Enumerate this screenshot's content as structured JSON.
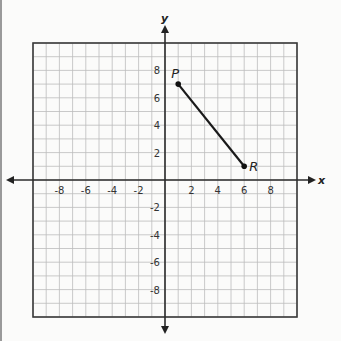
{
  "chart_data": {
    "type": "scatter",
    "title": "",
    "xlabel": "x",
    "ylabel": "y",
    "xlim": [
      -10,
      10
    ],
    "ylim": [
      -10,
      10
    ],
    "grid": true,
    "grid_step": 1,
    "x_ticks": [
      -8,
      -6,
      -4,
      -2,
      2,
      4,
      6,
      8
    ],
    "y_ticks": [
      8,
      6,
      4,
      2,
      -2,
      -4,
      -6,
      -8
    ],
    "x_tick_labels": [
      "-8",
      "-6",
      "-4",
      "-2",
      "2",
      "4",
      "6",
      "8"
    ],
    "y_tick_labels": [
      "8",
      "6",
      "4",
      "2",
      "-2",
      "-4",
      "-6",
      "-8"
    ],
    "points": [
      {
        "label": "P",
        "x": 1,
        "y": 7
      },
      {
        "label": "R",
        "x": 6,
        "y": 1
      }
    ],
    "segments": [
      {
        "from": "P",
        "to": "R"
      }
    ]
  },
  "labels": {
    "x_axis": "x",
    "y_axis": "y",
    "point_p": "P",
    "point_r": "R"
  }
}
